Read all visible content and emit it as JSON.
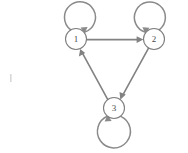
{
  "diagram": {
    "type": "directed-graph",
    "background_color": "#ffffff",
    "stroke_color": "#828282",
    "node_fill_color": "#ffffff",
    "node_stroke_color": "#7e7e7e",
    "label_color": "#4a4a4a",
    "nodes": [
      {
        "id": "1",
        "label": "1",
        "cx": 76,
        "cy": 39,
        "r": 10.5
      },
      {
        "id": "2",
        "label": "2",
        "cx": 154,
        "cy": 39,
        "r": 10.5
      },
      {
        "id": "3",
        "label": "3",
        "cx": 114,
        "cy": 108,
        "r": 10.5
      }
    ],
    "edges": [
      {
        "id": "edge-1-2",
        "from": "1",
        "to": "2",
        "label": "",
        "kind": "straight"
      },
      {
        "id": "edge-2-3",
        "from": "2",
        "to": "3",
        "label": "",
        "kind": "straight"
      },
      {
        "id": "edge-3-1",
        "from": "3",
        "to": "1",
        "label": "",
        "kind": "straight"
      }
    ],
    "self_loops": [
      {
        "id": "loop-1",
        "node": "1",
        "label": "",
        "position": "above-left"
      },
      {
        "id": "loop-2",
        "node": "2",
        "label": "",
        "position": "above-right"
      },
      {
        "id": "loop-3",
        "node": "3",
        "label": "",
        "position": "below"
      }
    ]
  }
}
